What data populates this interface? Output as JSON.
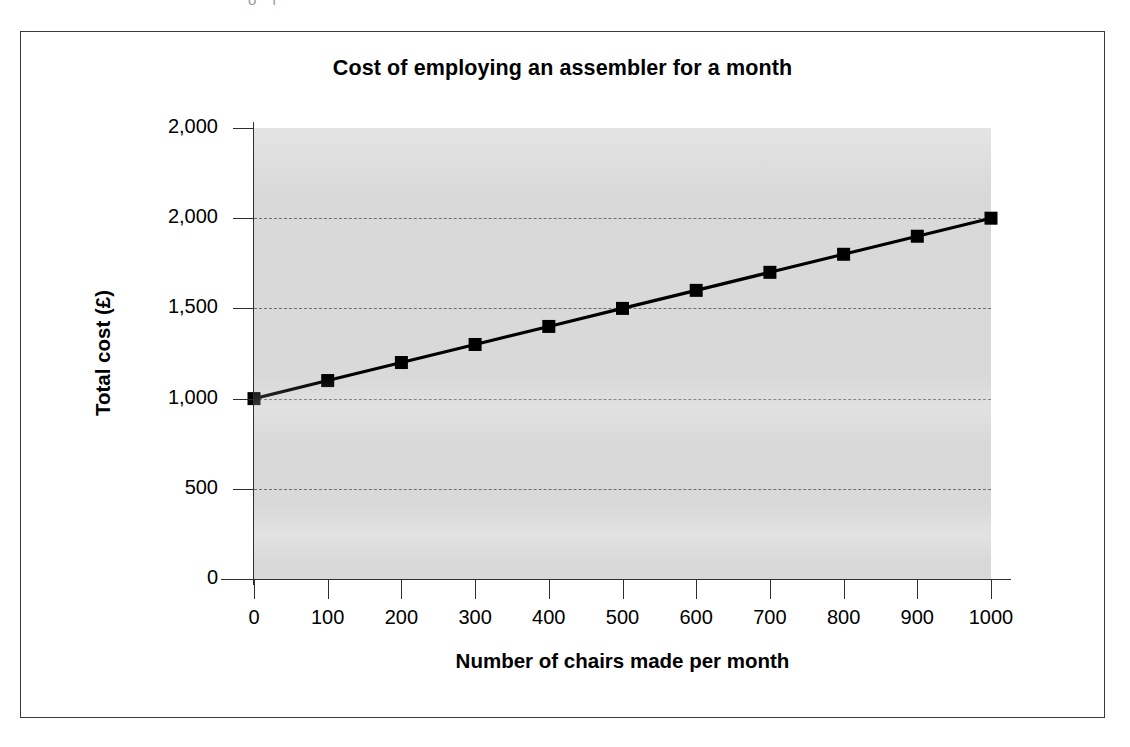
{
  "figure": {
    "caption_sliver": "o l"
  },
  "chart_data": {
    "type": "line",
    "title": "Cost of employing an assembler for a month",
    "xlabel": "Number of chairs made per month",
    "ylabel": "Total cost (£)",
    "x": [
      0,
      100,
      200,
      300,
      400,
      500,
      600,
      700,
      800,
      900,
      1000
    ],
    "values": [
      1000,
      1100,
      1200,
      1300,
      1400,
      1500,
      1600,
      1700,
      1800,
      1900,
      2000
    ],
    "series": [
      {
        "name": "Total cost",
        "values": [
          1000,
          1100,
          1200,
          1300,
          1400,
          1500,
          1600,
          1700,
          1800,
          1900,
          2000
        ]
      }
    ],
    "xtick_labels": [
      "0",
      "100",
      "200",
      "300",
      "400",
      "500",
      "600",
      "700",
      "800",
      "900",
      "1000"
    ],
    "ytick_values": [
      0,
      500,
      1000,
      1500,
      2000,
      2500
    ],
    "ytick_labels": [
      "0",
      "500",
      "1,000",
      "1,500",
      "2,000",
      "2,000"
    ],
    "xlim": [
      0,
      1000
    ],
    "ylim": [
      0,
      2500
    ],
    "grid": true,
    "grid_axis": "y",
    "grid_style": "dashed",
    "legend": false,
    "marker": "filled-square",
    "line_color": "#000000",
    "marker_color": "#000000",
    "plot_background": "#d9d9d9",
    "gridline_color": "#6f6f6f"
  }
}
